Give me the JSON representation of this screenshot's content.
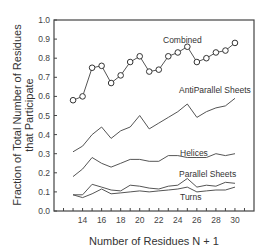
{
  "chart_data": {
    "type": "line",
    "title": "",
    "xlabel": "Number of Residues N + 1",
    "ylabel_lines": [
      "Fraction of Total Number of Residues",
      "that Participate"
    ],
    "xlim": [
      11,
      32
    ],
    "ylim": [
      0.0,
      1.0
    ],
    "grid": false,
    "legend": "inline labels",
    "x_ticks": [
      14,
      16,
      18,
      20,
      22,
      24,
      26,
      28,
      30
    ],
    "x_minor_ticks": [
      12,
      13,
      14,
      15,
      16,
      17,
      18,
      19,
      20,
      21,
      22,
      23,
      24,
      25,
      26,
      27,
      28,
      29,
      30,
      31
    ],
    "y_ticks": [
      "0.0",
      "0.1",
      "0.2",
      "0.3",
      "0.4",
      "0.5",
      "0.6",
      "0.7",
      "0.8",
      "0.9",
      "1.0"
    ],
    "x": [
      13,
      14,
      15,
      16,
      17,
      18,
      19,
      20,
      21,
      22,
      23,
      24,
      25,
      26,
      27,
      28,
      29,
      30
    ],
    "series": [
      {
        "name": "Combined",
        "markers": true,
        "values": [
          0.58,
          0.6,
          0.75,
          0.76,
          0.67,
          0.71,
          0.78,
          0.81,
          0.73,
          0.74,
          0.81,
          0.83,
          0.86,
          0.78,
          0.8,
          0.83,
          0.84,
          0.88
        ],
        "label_pos": [
          163,
          43
        ]
      },
      {
        "name": "AntiParallel Sheets",
        "markers": false,
        "values": [
          0.31,
          0.34,
          0.4,
          0.44,
          0.38,
          0.42,
          0.44,
          0.5,
          0.43,
          0.46,
          0.49,
          0.52,
          0.56,
          0.49,
          0.52,
          0.54,
          0.55,
          0.59
        ],
        "label_pos": [
          179,
          93
        ]
      },
      {
        "name": "Helices",
        "markers": false,
        "values": [
          0.18,
          0.22,
          0.28,
          0.25,
          0.23,
          0.25,
          0.27,
          0.27,
          0.26,
          0.26,
          0.29,
          0.29,
          0.28,
          0.28,
          0.28,
          0.3,
          0.29,
          0.3
        ],
        "label_pos": [
          180,
          156
        ]
      },
      {
        "name": "Parallel Sheets",
        "markers": false,
        "values": [
          0.085,
          0.085,
          0.14,
          0.125,
          0.11,
          0.105,
          0.135,
          0.13,
          0.12,
          0.115,
          0.13,
          0.135,
          0.17,
          0.125,
          0.135,
          0.13,
          0.15,
          0.145
        ],
        "label_pos": [
          179,
          177
        ]
      },
      {
        "name": "Turns",
        "markers": false,
        "values": [
          0.085,
          0.07,
          0.09,
          0.115,
          0.09,
          0.095,
          0.1,
          0.105,
          0.1,
          0.105,
          0.11,
          0.115,
          0.125,
          0.1,
          0.105,
          0.11,
          0.11,
          0.125
        ],
        "label_pos": [
          180,
          200
        ]
      }
    ]
  }
}
